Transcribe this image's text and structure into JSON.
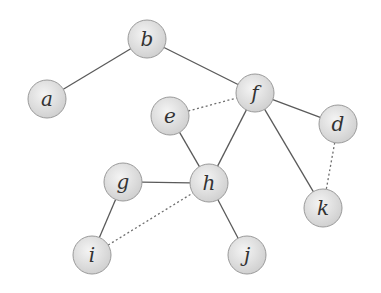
{
  "graph": {
    "node_radius": 19,
    "colors": {
      "node_fill_center": "#f4f4f4",
      "node_fill_edge": "#cfcfcf",
      "node_stroke": "#9a9a9a",
      "edge": "#5a5a5a",
      "label": "#333333"
    },
    "nodes": [
      {
        "id": "a",
        "label": "a",
        "x": 47,
        "y": 99
      },
      {
        "id": "b",
        "label": "b",
        "x": 147,
        "y": 39
      },
      {
        "id": "f",
        "label": "f",
        "x": 255,
        "y": 93
      },
      {
        "id": "e",
        "label": "e",
        "x": 170,
        "y": 116
      },
      {
        "id": "d",
        "label": "d",
        "x": 338,
        "y": 124
      },
      {
        "id": "g",
        "label": "g",
        "x": 123,
        "y": 182
      },
      {
        "id": "h",
        "label": "h",
        "x": 209,
        "y": 183
      },
      {
        "id": "k",
        "label": "k",
        "x": 323,
        "y": 208
      },
      {
        "id": "i",
        "label": "i",
        "x": 92,
        "y": 255
      },
      {
        "id": "j",
        "label": "j",
        "x": 247,
        "y": 255
      }
    ],
    "edges": [
      {
        "from": "a",
        "to": "b",
        "style": "solid"
      },
      {
        "from": "b",
        "to": "f",
        "style": "solid"
      },
      {
        "from": "f",
        "to": "d",
        "style": "solid"
      },
      {
        "from": "f",
        "to": "h",
        "style": "solid"
      },
      {
        "from": "f",
        "to": "k",
        "style": "solid"
      },
      {
        "from": "e",
        "to": "h",
        "style": "solid"
      },
      {
        "from": "g",
        "to": "h",
        "style": "solid"
      },
      {
        "from": "g",
        "to": "i",
        "style": "solid"
      },
      {
        "from": "h",
        "to": "j",
        "style": "solid"
      },
      {
        "from": "e",
        "to": "f",
        "style": "dashed"
      },
      {
        "from": "d",
        "to": "k",
        "style": "dashed"
      },
      {
        "from": "i",
        "to": "h",
        "style": "dashed"
      }
    ]
  }
}
